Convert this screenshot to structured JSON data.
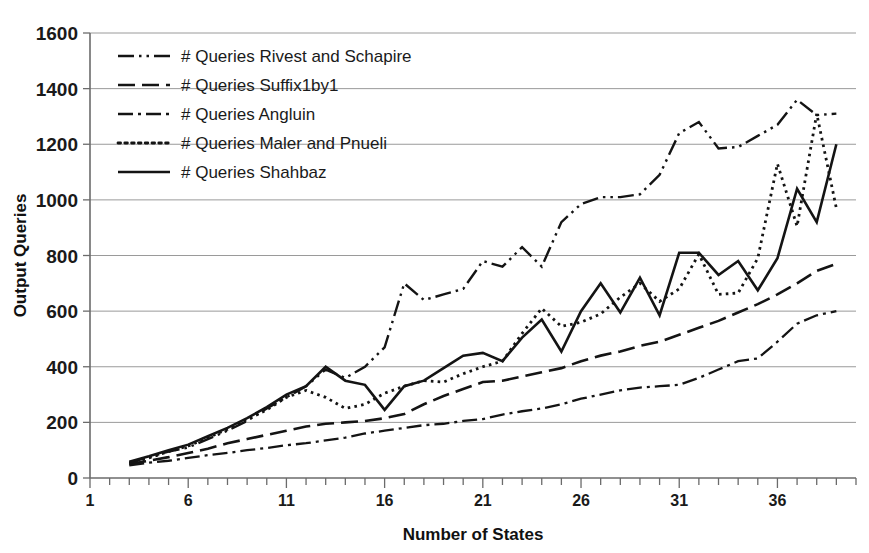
{
  "chart_data": {
    "type": "line",
    "title": "",
    "xlabel": "Number of States",
    "ylabel": "Output Queries",
    "xlim": [
      1,
      40
    ],
    "ylim": [
      0,
      1600
    ],
    "ytick_values": [
      0,
      200,
      400,
      600,
      800,
      1000,
      1200,
      1400,
      1600
    ],
    "ytick_labels": [
      "0",
      "200",
      "400",
      "600",
      "800",
      "1000",
      "1200",
      "1400",
      "1600"
    ],
    "xtick_values": [
      1,
      6,
      11,
      16,
      21,
      26,
      31,
      36
    ],
    "xtick_labels": [
      "1",
      "6",
      "11",
      "16",
      "21",
      "26",
      "31",
      "36"
    ],
    "xtick_minor_step": 1,
    "grid": "horizontal",
    "legend_position": "upper-left-inside",
    "line_color": "#141414",
    "grid_color": "#9a9a9a",
    "axis_color": "#6b6b6b",
    "x": [
      3,
      4,
      5,
      6,
      7,
      8,
      9,
      10,
      11,
      12,
      13,
      14,
      15,
      16,
      17,
      18,
      19,
      20,
      21,
      22,
      23,
      24,
      25,
      26,
      27,
      28,
      29,
      30,
      31,
      32,
      33,
      34,
      35,
      36,
      37,
      38,
      39
    ],
    "series": [
      {
        "name": "# Queries Rivest and Schapire",
        "dash": "long-dot-dot",
        "values": [
          55,
          75,
          95,
          110,
          140,
          170,
          205,
          250,
          290,
          330,
          390,
          360,
          400,
          470,
          700,
          640,
          660,
          680,
          780,
          760,
          830,
          760,
          920,
          985,
          1010,
          1010,
          1020,
          1090,
          1240,
          1280,
          1185,
          1190,
          1230,
          1270,
          1360,
          1305,
          1310
        ]
      },
      {
        "name": "# Queries Suffix1by1",
        "dash": "long-dash",
        "values": [
          50,
          62,
          75,
          90,
          105,
          125,
          140,
          155,
          170,
          185,
          195,
          200,
          205,
          215,
          230,
          265,
          295,
          320,
          345,
          350,
          365,
          380,
          395,
          420,
          440,
          455,
          475,
          490,
          515,
          540,
          565,
          595,
          625,
          660,
          700,
          745,
          770
        ]
      },
      {
        "name": "# Queries Angluin",
        "dash": "dash-dot",
        "values": [
          45,
          55,
          62,
          72,
          82,
          90,
          100,
          108,
          118,
          125,
          135,
          145,
          160,
          170,
          180,
          190,
          195,
          205,
          212,
          228,
          240,
          250,
          265,
          285,
          300,
          315,
          325,
          330,
          335,
          360,
          390,
          420,
          430,
          490,
          555,
          585,
          600
        ]
      },
      {
        "name": "# Queries Maler and Pnueli",
        "dash": "dotted",
        "values": [
          52,
          72,
          95,
          115,
          145,
          175,
          210,
          245,
          290,
          315,
          290,
          250,
          265,
          305,
          330,
          350,
          345,
          375,
          400,
          420,
          520,
          610,
          545,
          560,
          590,
          650,
          700,
          635,
          680,
          805,
          660,
          665,
          790,
          1130,
          905,
          1310,
          970
        ]
      },
      {
        "name": "# Queries Shahbaz",
        "dash": "solid",
        "values": [
          58,
          78,
          100,
          120,
          150,
          180,
          215,
          255,
          300,
          330,
          400,
          350,
          335,
          245,
          330,
          350,
          395,
          440,
          450,
          420,
          505,
          570,
          455,
          600,
          700,
          595,
          720,
          585,
          810,
          810,
          730,
          780,
          675,
          790,
          1040,
          920,
          1200
        ]
      }
    ]
  },
  "legend": {
    "items": [
      {
        "label": "# Queries Rivest and Schapire",
        "dash": "long-dot-dot"
      },
      {
        "label": "# Queries Suffix1by1",
        "dash": "long-dash"
      },
      {
        "label": "# Queries Angluin",
        "dash": "dash-dot"
      },
      {
        "label": "# Queries Maler and Pnueli",
        "dash": "dotted"
      },
      {
        "label": "# Queries Shahbaz",
        "dash": "solid"
      }
    ]
  }
}
